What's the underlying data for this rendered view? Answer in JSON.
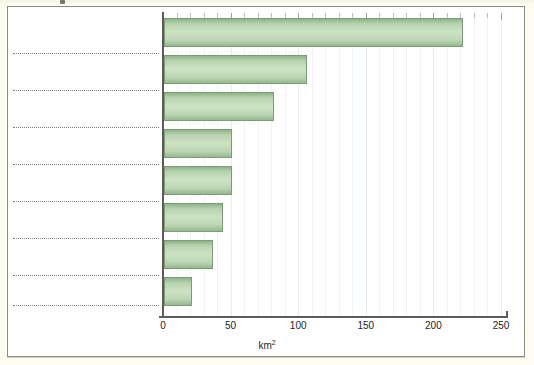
{
  "figure": {
    "background_color": "#fdfcf0",
    "plot_background_color": "#ffffff",
    "frame_color": "#8d8d86",
    "bar_fill_light": "#cde3c4",
    "bar_fill_dark": "#8fb488",
    "bar_border_color": "#7c9b78",
    "gridline_color": "#eef3f6",
    "axis_color": "#5c5c58"
  },
  "axis": {
    "x_title_text": "km",
    "x_title_exponent": "2",
    "x_ticks": [
      "0",
      "50",
      "100",
      "150",
      "200",
      "250"
    ]
  },
  "chart_data": {
    "type": "bar",
    "orientation": "horizontal",
    "title": "",
    "subtitle": "",
    "xlabel": "km²",
    "ylabel": "",
    "xlim": [
      0,
      250
    ],
    "xticks": [
      0,
      50,
      100,
      150,
      200,
      250
    ],
    "minor_tick_interval": 10,
    "grid": "vertical-minor",
    "legend": "none",
    "categories": [
      "",
      "",
      "",
      "",
      "",
      "",
      "",
      ""
    ],
    "values": [
      221,
      106,
      81,
      50,
      50,
      44,
      36,
      21
    ],
    "annotations": []
  }
}
